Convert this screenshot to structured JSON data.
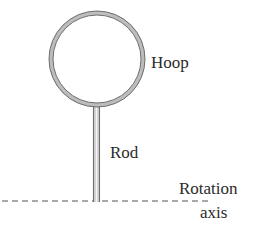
{
  "figure": {
    "labels": {
      "hoop": "Hoop",
      "rod": "Rod",
      "rotation": "Rotation",
      "axis": "axis"
    },
    "colors": {
      "outline": "#6e6e6e",
      "fill": "#bdbdbd",
      "text": "#2b2b2b",
      "dash": "#555555"
    },
    "caption_visible_fragment": ""
  }
}
